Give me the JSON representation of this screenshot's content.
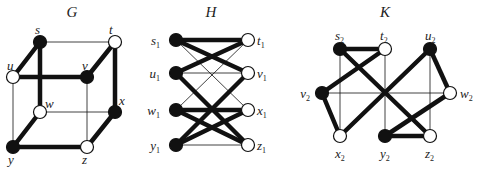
{
  "header_fragment": "graph",
  "graphs": [
    {
      "id": "G",
      "title": "G",
      "title_pos": [
        72,
        17
      ],
      "nodes": [
        {
          "name": "s",
          "sub": "",
          "x": 40,
          "y": 42,
          "fill": "black",
          "lx": 35,
          "ly": 34
        },
        {
          "name": "t",
          "sub": "",
          "x": 115,
          "y": 42,
          "fill": "white",
          "lx": 109,
          "ly": 34
        },
        {
          "name": "u",
          "sub": "",
          "x": 13,
          "y": 77,
          "fill": "white",
          "lx": 7,
          "ly": 70
        },
        {
          "name": "v",
          "sub": "",
          "x": 87,
          "y": 77,
          "fill": "black",
          "lx": 82,
          "ly": 70
        },
        {
          "name": "w",
          "sub": "",
          "x": 40,
          "y": 112,
          "fill": "white",
          "lx": 45,
          "ly": 108
        },
        {
          "name": "x",
          "sub": "",
          "x": 115,
          "y": 112,
          "fill": "black",
          "lx": 119,
          "ly": 105
        },
        {
          "name": "y",
          "sub": "",
          "x": 13,
          "y": 147,
          "fill": "black",
          "lx": 8,
          "ly": 164
        },
        {
          "name": "z",
          "sub": "",
          "x": 87,
          "y": 147,
          "fill": "white",
          "lx": 82,
          "ly": 164
        }
      ],
      "edges": [
        [
          "s",
          "t",
          "thin"
        ],
        [
          "s",
          "u",
          "thick"
        ],
        [
          "s",
          "w",
          "thick"
        ],
        [
          "t",
          "v",
          "thick"
        ],
        [
          "t",
          "x",
          "thick"
        ],
        [
          "u",
          "v",
          "thick"
        ],
        [
          "u",
          "y",
          "thin"
        ],
        [
          "v",
          "z",
          "thin"
        ],
        [
          "w",
          "x",
          "thin"
        ],
        [
          "w",
          "y",
          "thick"
        ],
        [
          "x",
          "z",
          "thick"
        ],
        [
          "y",
          "z",
          "thick"
        ]
      ]
    },
    {
      "id": "H",
      "title": "H",
      "title_pos": [
        211,
        17
      ],
      "nodes": [
        {
          "name": "s",
          "sub": "1",
          "x": 176,
          "y": 40,
          "fill": "black",
          "lx": 160,
          "ly": 45,
          "anchor": "end"
        },
        {
          "name": "u",
          "sub": "1",
          "x": 176,
          "y": 73,
          "fill": "black",
          "lx": 160,
          "ly": 78,
          "anchor": "end"
        },
        {
          "name": "w",
          "sub": "1",
          "x": 176,
          "y": 110,
          "fill": "black",
          "lx": 160,
          "ly": 115,
          "anchor": "end"
        },
        {
          "name": "y",
          "sub": "1",
          "x": 176,
          "y": 145,
          "fill": "black",
          "lx": 160,
          "ly": 150,
          "anchor": "end"
        },
        {
          "name": "t",
          "sub": "1",
          "x": 248,
          "y": 40,
          "fill": "white",
          "lx": 257,
          "ly": 45
        },
        {
          "name": "v",
          "sub": "1",
          "x": 248,
          "y": 73,
          "fill": "white",
          "lx": 257,
          "ly": 78
        },
        {
          "name": "x",
          "sub": "1",
          "x": 248,
          "y": 110,
          "fill": "white",
          "lx": 257,
          "ly": 115
        },
        {
          "name": "z",
          "sub": "1",
          "x": 248,
          "y": 145,
          "fill": "white",
          "lx": 257,
          "ly": 150
        }
      ],
      "edges": [
        [
          "s",
          "t",
          "thick"
        ],
        [
          "s",
          "v",
          "thick"
        ],
        [
          "s",
          "x",
          "thin"
        ],
        [
          "u",
          "t",
          "thick"
        ],
        [
          "u",
          "v",
          "thin"
        ],
        [
          "u",
          "z",
          "thick"
        ],
        [
          "w",
          "t",
          "thin"
        ],
        [
          "w",
          "x",
          "thick"
        ],
        [
          "w",
          "z",
          "thick"
        ],
        [
          "y",
          "v",
          "thick"
        ],
        [
          "y",
          "x",
          "thick"
        ],
        [
          "y",
          "z",
          "thin"
        ]
      ]
    },
    {
      "id": "K",
      "title": "K",
      "title_pos": [
        385,
        17
      ],
      "nodes": [
        {
          "name": "s",
          "sub": "2",
          "x": 340,
          "y": 49,
          "fill": "black",
          "lx": 335,
          "ly": 40
        },
        {
          "name": "t",
          "sub": "2",
          "x": 385,
          "y": 49,
          "fill": "white",
          "lx": 380,
          "ly": 40
        },
        {
          "name": "u",
          "sub": "2",
          "x": 430,
          "y": 49,
          "fill": "black",
          "lx": 425,
          "ly": 40
        },
        {
          "name": "v",
          "sub": "2",
          "x": 322,
          "y": 93,
          "fill": "black",
          "lx": 310,
          "ly": 98,
          "anchor": "end"
        },
        {
          "name": "w",
          "sub": "2",
          "x": 450,
          "y": 93,
          "fill": "white",
          "lx": 460,
          "ly": 98
        },
        {
          "name": "x",
          "sub": "2",
          "x": 340,
          "y": 136,
          "fill": "white",
          "lx": 335,
          "ly": 158
        },
        {
          "name": "y",
          "sub": "2",
          "x": 385,
          "y": 136,
          "fill": "black",
          "lx": 380,
          "ly": 158
        },
        {
          "name": "z",
          "sub": "2",
          "x": 430,
          "y": 136,
          "fill": "white",
          "lx": 425,
          "ly": 158
        }
      ],
      "edges": [
        [
          "s",
          "t",
          "thick"
        ],
        [
          "s",
          "z",
          "thick"
        ],
        [
          "s",
          "x",
          "thin"
        ],
        [
          "t",
          "v",
          "thick"
        ],
        [
          "t",
          "y",
          "thin"
        ],
        [
          "u",
          "x",
          "thick"
        ],
        [
          "u",
          "w",
          "thick"
        ],
        [
          "u",
          "z",
          "thin"
        ],
        [
          "v",
          "x",
          "thick"
        ],
        [
          "v",
          "w",
          "thin"
        ],
        [
          "w",
          "y",
          "thick"
        ],
        [
          "y",
          "z",
          "thick"
        ]
      ]
    }
  ],
  "style": {
    "edge_color": "#111111",
    "thick_width": 4.5,
    "thin_width": 0.8,
    "node_radius": 6.5,
    "node_stroke": "#111111"
  }
}
